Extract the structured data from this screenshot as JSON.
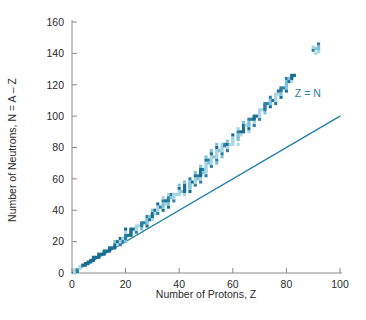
{
  "chart_data": {
    "type": "scatter",
    "title": "",
    "xlabel": "Number of Protons, Z",
    "ylabel": "Number of Neutrons, N = A – Z",
    "xlim": [
      0,
      100
    ],
    "ylim": [
      0,
      160
    ],
    "xticks": [
      0,
      20,
      40,
      60,
      80,
      100
    ],
    "yticks": [
      0,
      20,
      40,
      60,
      80,
      100,
      120,
      140,
      160
    ],
    "grid": false,
    "legend": "none",
    "marker": "square",
    "marker_colors": [
      "#2e7fa6",
      "#7fc3d8",
      "#1b6e92",
      "#a8d6e4"
    ],
    "annotations": [
      {
        "text": "Z = N",
        "x": 88,
        "y": 112,
        "color": "#1b7fa8"
      }
    ],
    "reference_line": {
      "name": "Z = N",
      "x": [
        0,
        100
      ],
      "y": [
        0,
        100
      ],
      "color": "#1b7fa8",
      "width": 1.3
    },
    "series": [
      {
        "name": "Stable nuclides",
        "color": "#2e7fa6",
        "points": [
          [
            1,
            0
          ],
          [
            1,
            1
          ],
          [
            1,
            2
          ],
          [
            2,
            1
          ],
          [
            2,
            2
          ],
          [
            3,
            3
          ],
          [
            3,
            4
          ],
          [
            4,
            5
          ],
          [
            5,
            5
          ],
          [
            5,
            6
          ],
          [
            6,
            6
          ],
          [
            6,
            7
          ],
          [
            7,
            7
          ],
          [
            7,
            8
          ],
          [
            8,
            8
          ],
          [
            8,
            9
          ],
          [
            8,
            10
          ],
          [
            9,
            10
          ],
          [
            10,
            10
          ],
          [
            10,
            11
          ],
          [
            10,
            12
          ],
          [
            11,
            12
          ],
          [
            12,
            12
          ],
          [
            12,
            13
          ],
          [
            12,
            14
          ],
          [
            13,
            14
          ],
          [
            14,
            14
          ],
          [
            14,
            15
          ],
          [
            14,
            16
          ],
          [
            15,
            16
          ],
          [
            16,
            16
          ],
          [
            16,
            17
          ],
          [
            16,
            18
          ],
          [
            16,
            20
          ],
          [
            17,
            18
          ],
          [
            17,
            20
          ],
          [
            18,
            18
          ],
          [
            18,
            20
          ],
          [
            18,
            22
          ],
          [
            19,
            20
          ],
          [
            19,
            22
          ],
          [
            20,
            20
          ],
          [
            20,
            22
          ],
          [
            20,
            23
          ],
          [
            20,
            24
          ],
          [
            20,
            26
          ],
          [
            20,
            28
          ],
          [
            21,
            24
          ],
          [
            22,
            24
          ],
          [
            22,
            25
          ],
          [
            22,
            26
          ],
          [
            22,
            27
          ],
          [
            22,
            28
          ],
          [
            23,
            28
          ],
          [
            24,
            26
          ],
          [
            24,
            28
          ],
          [
            24,
            29
          ],
          [
            24,
            30
          ],
          [
            25,
            30
          ],
          [
            26,
            28
          ],
          [
            26,
            30
          ],
          [
            26,
            31
          ],
          [
            26,
            32
          ],
          [
            27,
            32
          ],
          [
            28,
            30
          ],
          [
            28,
            32
          ],
          [
            28,
            33
          ],
          [
            28,
            34
          ],
          [
            28,
            36
          ],
          [
            29,
            34
          ],
          [
            29,
            36
          ],
          [
            30,
            34
          ],
          [
            30,
            36
          ],
          [
            30,
            37
          ],
          [
            30,
            38
          ],
          [
            30,
            40
          ],
          [
            31,
            38
          ],
          [
            31,
            40
          ],
          [
            32,
            38
          ],
          [
            32,
            40
          ],
          [
            32,
            41
          ],
          [
            32,
            42
          ],
          [
            32,
            44
          ],
          [
            33,
            42
          ],
          [
            34,
            40
          ],
          [
            34,
            42
          ],
          [
            34,
            43
          ],
          [
            34,
            44
          ],
          [
            34,
            46
          ],
          [
            34,
            48
          ],
          [
            35,
            44
          ],
          [
            35,
            46
          ],
          [
            36,
            42
          ],
          [
            36,
            44
          ],
          [
            36,
            46
          ],
          [
            36,
            47
          ],
          [
            36,
            48
          ],
          [
            36,
            50
          ],
          [
            37,
            48
          ],
          [
            37,
            50
          ],
          [
            38,
            46
          ],
          [
            38,
            48
          ],
          [
            38,
            49
          ],
          [
            38,
            50
          ],
          [
            39,
            50
          ],
          [
            40,
            50
          ],
          [
            40,
            51
          ],
          [
            40,
            52
          ],
          [
            40,
            54
          ],
          [
            40,
            56
          ],
          [
            41,
            52
          ],
          [
            42,
            50
          ],
          [
            42,
            52
          ],
          [
            42,
            53
          ],
          [
            42,
            54
          ],
          [
            42,
            55
          ],
          [
            42,
            56
          ],
          [
            42,
            58
          ],
          [
            44,
            52
          ],
          [
            44,
            54
          ],
          [
            44,
            55
          ],
          [
            44,
            56
          ],
          [
            44,
            57
          ],
          [
            44,
            58
          ],
          [
            44,
            60
          ],
          [
            45,
            58
          ],
          [
            46,
            56
          ],
          [
            46,
            58
          ],
          [
            46,
            59
          ],
          [
            46,
            60
          ],
          [
            46,
            62
          ],
          [
            46,
            64
          ],
          [
            47,
            60
          ],
          [
            47,
            62
          ],
          [
            48,
            58
          ],
          [
            48,
            60
          ],
          [
            48,
            62
          ],
          [
            48,
            63
          ],
          [
            48,
            64
          ],
          [
            48,
            65
          ],
          [
            48,
            66
          ],
          [
            48,
            68
          ],
          [
            49,
            64
          ],
          [
            49,
            66
          ],
          [
            50,
            62
          ],
          [
            50,
            64
          ],
          [
            50,
            65
          ],
          [
            50,
            66
          ],
          [
            50,
            67
          ],
          [
            50,
            68
          ],
          [
            50,
            69
          ],
          [
            50,
            70
          ],
          [
            50,
            72
          ],
          [
            50,
            74
          ],
          [
            51,
            70
          ],
          [
            51,
            72
          ],
          [
            52,
            68
          ],
          [
            52,
            70
          ],
          [
            52,
            71
          ],
          [
            52,
            72
          ],
          [
            52,
            73
          ],
          [
            52,
            74
          ],
          [
            52,
            76
          ],
          [
            52,
            78
          ],
          [
            53,
            74
          ],
          [
            54,
            70
          ],
          [
            54,
            72
          ],
          [
            54,
            74
          ],
          [
            54,
            75
          ],
          [
            54,
            76
          ],
          [
            54,
            77
          ],
          [
            54,
            78
          ],
          [
            54,
            80
          ],
          [
            54,
            82
          ],
          [
            55,
            78
          ],
          [
            56,
            74
          ],
          [
            56,
            76
          ],
          [
            56,
            78
          ],
          [
            56,
            79
          ],
          [
            56,
            80
          ],
          [
            56,
            81
          ],
          [
            56,
            82
          ],
          [
            57,
            81
          ],
          [
            57,
            82
          ],
          [
            58,
            78
          ],
          [
            58,
            80
          ],
          [
            58,
            82
          ],
          [
            58,
            84
          ],
          [
            59,
            82
          ],
          [
            60,
            82
          ],
          [
            60,
            83
          ],
          [
            60,
            84
          ],
          [
            60,
            85
          ],
          [
            60,
            86
          ],
          [
            60,
            88
          ],
          [
            62,
            82
          ],
          [
            62,
            85
          ],
          [
            62,
            86
          ],
          [
            62,
            87
          ],
          [
            62,
            88
          ],
          [
            62,
            90
          ],
          [
            62,
            92
          ],
          [
            63,
            88
          ],
          [
            63,
            90
          ],
          [
            64,
            90
          ],
          [
            64,
            91
          ],
          [
            64,
            92
          ],
          [
            64,
            93
          ],
          [
            64,
            94
          ],
          [
            64,
            96
          ],
          [
            65,
            94
          ],
          [
            66,
            90
          ],
          [
            66,
            92
          ],
          [
            66,
            94
          ],
          [
            66,
            95
          ],
          [
            66,
            96
          ],
          [
            66,
            98
          ],
          [
            67,
            98
          ],
          [
            68,
            94
          ],
          [
            68,
            96
          ],
          [
            68,
            98
          ],
          [
            68,
            99
          ],
          [
            68,
            100
          ],
          [
            69,
            100
          ],
          [
            70,
            98
          ],
          [
            70,
            100
          ],
          [
            70,
            101
          ],
          [
            70,
            102
          ],
          [
            70,
            103
          ],
          [
            70,
            104
          ],
          [
            71,
            104
          ],
          [
            72,
            102
          ],
          [
            72,
            104
          ],
          [
            72,
            105
          ],
          [
            72,
            106
          ],
          [
            72,
            107
          ],
          [
            72,
            108
          ],
          [
            73,
            108
          ],
          [
            74,
            106
          ],
          [
            74,
            108
          ],
          [
            74,
            109
          ],
          [
            74,
            110
          ],
          [
            74,
            112
          ],
          [
            75,
            110
          ],
          [
            76,
            108
          ],
          [
            76,
            110
          ],
          [
            76,
            111
          ],
          [
            76,
            112
          ],
          [
            76,
            113
          ],
          [
            76,
            114
          ],
          [
            77,
            114
          ],
          [
            77,
            116
          ],
          [
            78,
            112
          ],
          [
            78,
            114
          ],
          [
            78,
            116
          ],
          [
            78,
            117
          ],
          [
            78,
            118
          ],
          [
            79,
            118
          ],
          [
            80,
            116
          ],
          [
            80,
            118
          ],
          [
            80,
            119
          ],
          [
            80,
            120
          ],
          [
            80,
            121
          ],
          [
            80,
            122
          ],
          [
            80,
            124
          ],
          [
            81,
            122
          ],
          [
            81,
            124
          ],
          [
            82,
            122
          ],
          [
            82,
            124
          ],
          [
            82,
            125
          ],
          [
            82,
            126
          ],
          [
            83,
            126
          ],
          [
            90,
            142
          ],
          [
            90,
            144
          ],
          [
            91,
            140
          ],
          [
            92,
            142
          ],
          [
            92,
            143
          ],
          [
            92,
            144
          ],
          [
            92,
            146
          ],
          [
            91,
            143
          ],
          [
            92,
            141
          ]
        ]
      }
    ]
  },
  "axis": {
    "x_tick_labels": [
      "0",
      "20",
      "40",
      "60",
      "80",
      "100"
    ],
    "y_tick_labels": [
      "0",
      "20",
      "40",
      "60",
      "80",
      "100",
      "120",
      "140",
      "160"
    ],
    "x_title": "Number of Protons, Z",
    "y_title": "Number of Neutrons, N = A – Z"
  },
  "colors": {
    "axis": "#8a8a8a",
    "text": "#2b2b2b",
    "accent": "#1b7fa8",
    "marker_dark": "#2e7fa6",
    "marker_light": "#8ecbdd"
  }
}
